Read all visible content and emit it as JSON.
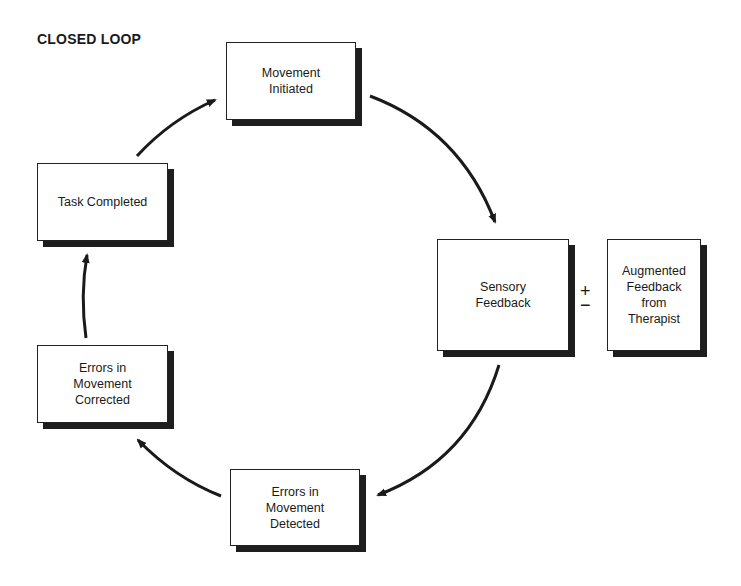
{
  "title": "CLOSED LOOP",
  "nodes": {
    "movement_initiated": "Movement\nInitiated",
    "sensory_feedback": "Sensory\nFeedback",
    "augmented_feedback": "Augmented\nFeedback\nfrom\nTherapist",
    "errors_detected": "Errors in\nMovement\nDetected",
    "errors_corrected": "Errors in\nMovement\nCorrected",
    "task_completed": "Task Completed"
  },
  "operator": {
    "plus": "+",
    "minus": "−"
  },
  "edges": [
    {
      "from": "Movement Initiated",
      "to": "Sensory Feedback"
    },
    {
      "from": "Sensory Feedback",
      "to": "Errors in Movement Detected"
    },
    {
      "from": "Errors in Movement Detected",
      "to": "Errors in Movement Corrected"
    },
    {
      "from": "Errors in Movement Corrected",
      "to": "Task Completed"
    },
    {
      "from": "Task Completed",
      "to": "Movement Initiated"
    }
  ]
}
